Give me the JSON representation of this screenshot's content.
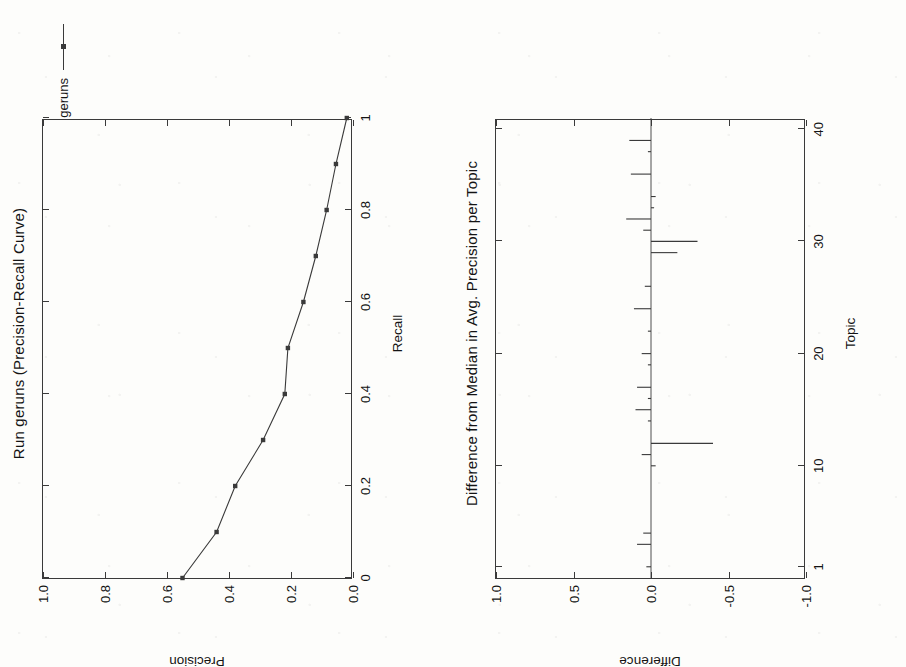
{
  "page": {
    "background_color": "#fdfdfb",
    "ink_color": "#1b1b1b",
    "orientation_note": "two landscape charts rotated 90 degrees counter-clockwise on a scanned page"
  },
  "chart_data": [
    {
      "id": "precision-recall",
      "type": "line",
      "title": "Run geruns (Precision-Recall Curve)",
      "xlabel": "Recall",
      "ylabel": "Precision",
      "xlim": [
        0,
        1
      ],
      "ylim": [
        0,
        1
      ],
      "grid": false,
      "legend_position": "top-right",
      "legend": [
        "geruns"
      ],
      "xticks": [
        "0",
        "0.2",
        "0.4",
        "0.6",
        "0.8",
        "1"
      ],
      "xtick_values": [
        0,
        0.2,
        0.4,
        0.6,
        0.8,
        1
      ],
      "yticks": [
        "0.0",
        "0.2",
        "0.4",
        "0.6",
        "0.8",
        "1.0"
      ],
      "ytick_values": [
        0,
        0.2,
        0.4,
        0.6,
        0.8,
        1.0
      ],
      "series": [
        {
          "name": "geruns",
          "x": [
            0.0,
            0.1,
            0.2,
            0.3,
            0.4,
            0.5,
            0.6,
            0.7,
            0.8,
            0.9,
            1.0
          ],
          "values": [
            0.55,
            0.44,
            0.38,
            0.29,
            0.22,
            0.21,
            0.16,
            0.12,
            0.085,
            0.055,
            0.02
          ]
        }
      ]
    },
    {
      "id": "difference-from-median",
      "type": "bar",
      "title": "Difference from Median in Avg. Precision per Topic",
      "xlabel": "Topic",
      "ylabel": "Difference",
      "xlim": [
        0,
        41
      ],
      "ylim": [
        -1.0,
        1.0
      ],
      "grid": false,
      "xticks": [
        "1",
        "10",
        "20",
        "30",
        "40"
      ],
      "xtick_values": [
        1,
        10,
        20,
        30,
        40
      ],
      "yticks": [
        "-1.0",
        "-0.5",
        "0.0",
        "0.5",
        "1.0"
      ],
      "ytick_values": [
        -1.0,
        -0.5,
        0.0,
        0.5,
        1.0
      ],
      "categories": [
        1,
        2,
        3,
        4,
        5,
        6,
        7,
        8,
        9,
        10,
        11,
        12,
        13,
        14,
        15,
        16,
        17,
        18,
        19,
        20,
        21,
        22,
        23,
        24,
        25,
        26,
        27,
        28,
        29,
        30,
        31,
        32,
        33,
        34,
        35,
        36,
        37,
        38,
        39,
        40
      ],
      "values": [
        0.03,
        0.0,
        0.09,
        0.05,
        0.0,
        0.0,
        0.0,
        0.0,
        0.0,
        -0.03,
        0.06,
        -0.4,
        0.0,
        0.02,
        0.1,
        0.02,
        0.09,
        0.0,
        0.02,
        0.06,
        0.0,
        0.02,
        0.0,
        0.11,
        0.0,
        0.04,
        0.0,
        0.0,
        -0.17,
        -0.3,
        0.05,
        0.16,
        -0.02,
        -0.03,
        0.0,
        0.13,
        0.0,
        0.02,
        0.14,
        0.0
      ]
    }
  ]
}
